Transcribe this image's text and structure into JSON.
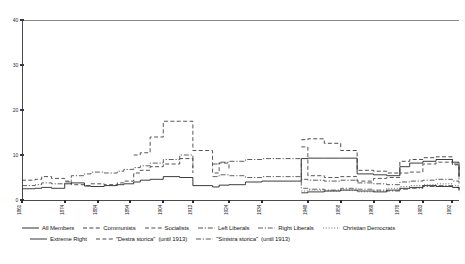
{
  "chart_data": {
    "type": "line",
    "title": "",
    "subtitle": "",
    "xlabel": "",
    "ylabel": "",
    "ylim": [
      0,
      40
    ],
    "yticks": [
      0,
      10,
      20,
      30,
      40
    ],
    "grid": false,
    "legend_position": "bottom",
    "x": [
      1861,
      1865,
      1867,
      1870,
      1874,
      1876,
      1880,
      1882,
      1886,
      1890,
      1892,
      1895,
      1897,
      1900,
      1904,
      1909,
      1913,
      1919,
      1921,
      1924,
      1929,
      1934,
      1946,
      1948,
      1953,
      1958,
      1963,
      1968,
      1972,
      1976,
      1979,
      1983,
      1987,
      1992,
      1994
    ],
    "xticks": [
      1861,
      1874,
      1884,
      1894,
      1904,
      1913,
      1924,
      1934,
      1948,
      1958,
      1968,
      1976,
      1983,
      1992
    ],
    "xtick_labels": [
      "1861",
      "1874",
      "1884",
      "1894",
      "1904",
      "1913",
      "1924",
      "1934",
      "1948",
      "1958",
      "1968",
      "1976",
      "1983",
      "1992"
    ],
    "series": [
      {
        "name": "All Members",
        "style": "solid",
        "color": "#1a1a1a",
        "values": [
          2.5,
          2.6,
          2.8,
          2.6,
          3.6,
          3.8,
          3.1,
          3.0,
          3.2,
          3.4,
          3.6,
          4.0,
          4.4,
          4.6,
          5.2,
          5.0,
          3.2,
          2.9,
          3.3,
          3.4,
          4.0,
          4.2,
          9.2,
          9.3,
          9.3,
          9.3,
          5.8,
          5.6,
          5.4,
          7.4,
          8.2,
          8.6,
          9.0,
          8.4,
          5.2
        ]
      },
      {
        "name": "Communists",
        "style": "dashed",
        "color": "#2e2e2e",
        "values": [
          null,
          null,
          null,
          null,
          null,
          null,
          null,
          null,
          null,
          null,
          null,
          null,
          null,
          null,
          null,
          null,
          null,
          null,
          null,
          null,
          null,
          null,
          13.4,
          13.6,
          12.6,
          11.0,
          6.6,
          6.4,
          6.0,
          8.6,
          9.0,
          9.4,
          9.6,
          8.0,
          4.6
        ]
      },
      {
        "name": "Socialists",
        "style": "dashed",
        "color": "#3a3a3a",
        "values": [
          null,
          null,
          null,
          null,
          null,
          null,
          null,
          null,
          null,
          null,
          null,
          10.0,
          10.5,
          14.0,
          17.5,
          17.5,
          11.0,
          6.0,
          8.2,
          7.0,
          null,
          null,
          11.8,
          5.4,
          5.0,
          5.2,
          4.2,
          4.8,
          5.0,
          6.0,
          6.2,
          8.0,
          8.4,
          7.8,
          4.6
        ]
      },
      {
        "name": "Left Liberals",
        "style": "dashdot",
        "color": "#404040",
        "values": [
          null,
          null,
          null,
          null,
          null,
          null,
          null,
          null,
          null,
          null,
          null,
          null,
          null,
          null,
          null,
          null,
          null,
          8.0,
          8.4,
          8.6,
          9.0,
          9.2,
          4.6,
          4.4,
          4.2,
          4.4,
          3.8,
          3.6,
          3.4,
          4.0,
          4.2,
          4.4,
          4.6,
          4.2,
          3.4
        ]
      },
      {
        "name": "Right Liberals",
        "style": "dashdot",
        "color": "#4a4a4a",
        "values": [
          null,
          null,
          null,
          null,
          null,
          null,
          null,
          null,
          null,
          null,
          null,
          null,
          null,
          null,
          null,
          null,
          null,
          5.2,
          5.6,
          5.4,
          5.0,
          5.2,
          2.6,
          2.4,
          2.2,
          2.6,
          2.4,
          2.2,
          2.0,
          2.4,
          2.6,
          3.0,
          3.2,
          2.8,
          2.4
        ]
      },
      {
        "name": "Christian Democrats",
        "style": "dotted",
        "color": "#5a5a5a",
        "values": [
          null,
          null,
          null,
          null,
          null,
          null,
          null,
          null,
          null,
          null,
          null,
          null,
          null,
          null,
          null,
          null,
          null,
          null,
          null,
          null,
          null,
          null,
          2.0,
          2.2,
          2.0,
          2.2,
          1.8,
          2.0,
          2.6,
          3.0,
          3.2,
          3.4,
          3.6,
          3.2,
          1.6
        ]
      },
      {
        "name": "Extreme Right",
        "style": "solid",
        "color": "#222222",
        "values": [
          null,
          null,
          null,
          null,
          null,
          null,
          null,
          null,
          null,
          null,
          null,
          null,
          null,
          null,
          null,
          null,
          null,
          null,
          null,
          null,
          null,
          null,
          1.6,
          1.8,
          2.0,
          2.2,
          2.0,
          1.8,
          2.2,
          2.6,
          2.8,
          3.2,
          3.0,
          2.8,
          2.2
        ]
      },
      {
        "name": "\"Destra storica\"",
        "note": "(until 1913)",
        "style": "dashed",
        "color": "#333333",
        "values": [
          4.4,
          4.6,
          5.2,
          4.8,
          4.2,
          3.4,
          3.2,
          3.6,
          3.4,
          3.8,
          4.2,
          6.0,
          6.6,
          7.4,
          8.0,
          9.2,
          6.0,
          null,
          null,
          null,
          null,
          null,
          null,
          null,
          null,
          null,
          null,
          null,
          null,
          null,
          null,
          null,
          null,
          null,
          null
        ]
      },
      {
        "name": "\"Sinistra storica\"",
        "note": "(until 1913)",
        "style": "dashdot",
        "color": "#444444",
        "values": [
          3.2,
          3.4,
          3.8,
          3.6,
          4.0,
          5.4,
          5.8,
          6.2,
          6.0,
          6.4,
          6.8,
          7.2,
          7.6,
          8.2,
          9.0,
          10.0,
          7.0,
          null,
          null,
          null,
          null,
          null,
          null,
          null,
          null,
          null,
          null,
          null,
          null,
          null,
          null,
          null,
          null,
          null,
          null
        ]
      }
    ]
  }
}
